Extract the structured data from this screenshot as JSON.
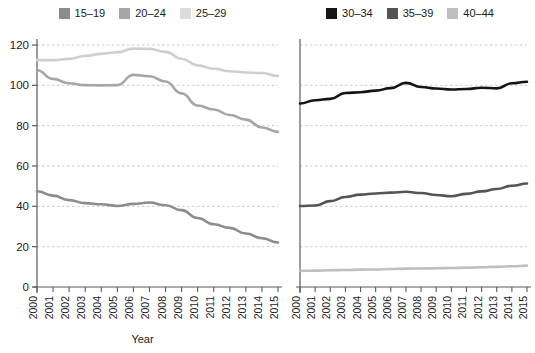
{
  "chart_data": [
    {
      "type": "line",
      "panel": "left",
      "title": "",
      "xlabel": "Year",
      "ylabel": "",
      "x": [
        2000,
        2001,
        2002,
        2003,
        2004,
        2005,
        2006,
        2007,
        2008,
        2009,
        2010,
        2011,
        2012,
        2013,
        2014,
        2015
      ],
      "categories": [
        "2000",
        "2001",
        "2002",
        "2003",
        "2004",
        "2005",
        "2006",
        "2007",
        "2008",
        "2009",
        "2010",
        "2011",
        "2012",
        "2013",
        "2014",
        "2015"
      ],
      "ylim": [
        0,
        120
      ],
      "yticks": [
        0,
        20,
        40,
        60,
        80,
        100,
        120
      ],
      "grid": true,
      "legend_position": "top",
      "series": [
        {
          "name": "15-19",
          "color": "#8c8c8c",
          "values": [
            47.5,
            45.3,
            43.1,
            41.6,
            41.0,
            40.2,
            41.2,
            41.9,
            40.5,
            38.1,
            34.2,
            31.1,
            29.3,
            26.5,
            24.2,
            22.1
          ]
        },
        {
          "name": "20-24",
          "color": "#a6a6a6",
          "values": [
            107.5,
            103.2,
            101.0,
            100.1,
            100.0,
            100.1,
            105.2,
            104.5,
            101.9,
            96.0,
            90.0,
            88.0,
            85.3,
            83.0,
            79.1,
            76.9
          ]
        },
        {
          "name": "25-29",
          "color": "#cfcfcf",
          "values": [
            112.5,
            112.5,
            113.1,
            114.6,
            115.6,
            116.4,
            118.2,
            118.1,
            116.6,
            113.2,
            109.9,
            108.2,
            107.0,
            106.4,
            106.1,
            104.6
          ]
        }
      ]
    },
    {
      "type": "line",
      "panel": "right",
      "title": "",
      "xlabel": "Year",
      "ylabel": "",
      "x": [
        2000,
        2001,
        2002,
        2003,
        2004,
        2005,
        2006,
        2007,
        2008,
        2009,
        2010,
        2011,
        2012,
        2013,
        2014,
        2015
      ],
      "categories": [
        "2000",
        "2001",
        "2002",
        "2003",
        "2004",
        "2005",
        "2006",
        "2007",
        "2008",
        "2009",
        "2010",
        "2011",
        "2012",
        "2013",
        "2014",
        "2015"
      ],
      "ylim": [
        0,
        120
      ],
      "yticks": [
        0,
        20,
        40,
        60,
        80,
        100,
        120
      ],
      "grid": true,
      "legend_position": "top",
      "series": [
        {
          "name": "30-34",
          "color": "#141414",
          "values": [
            91.0,
            92.6,
            93.3,
            96.2,
            96.6,
            97.4,
            98.6,
            101.2,
            99.2,
            98.4,
            97.9,
            98.2,
            98.8,
            98.5,
            101.0,
            101.8
          ]
        },
        {
          "name": "35-39",
          "color": "#545454",
          "values": [
            40.2,
            40.4,
            42.6,
            44.6,
            45.8,
            46.4,
            46.8,
            47.2,
            46.6,
            45.6,
            45.0,
            46.2,
            47.4,
            48.6,
            50.2,
            51.3
          ]
        },
        {
          "name": "40-44",
          "color": "#bfbfbf",
          "values": [
            8.0,
            8.1,
            8.3,
            8.4,
            8.6,
            8.7,
            8.9,
            9.1,
            9.2,
            9.3,
            9.4,
            9.6,
            9.8,
            10.0,
            10.3,
            10.6
          ]
        }
      ]
    }
  ],
  "legend_left": {
    "items": [
      {
        "label": "15–19",
        "color": "#8c8c8c"
      },
      {
        "label": "20–24",
        "color": "#a6a6a6"
      },
      {
        "label": "25–29",
        "color": "#dcdcdc"
      }
    ]
  },
  "legend_right": {
    "items": [
      {
        "label": "30–34",
        "color": "#141414"
      },
      {
        "label": "35–39",
        "color": "#545454"
      },
      {
        "label": "40–44",
        "color": "#bfbfbf"
      }
    ]
  },
  "axes": {
    "xlabel_left": "Year",
    "xlabel_right": "Year",
    "ytick_labels": [
      "0",
      "20",
      "40",
      "60",
      "80",
      "100",
      "120"
    ],
    "xtick_labels": [
      "2000",
      "2001",
      "2002",
      "2003",
      "2004",
      "2005",
      "2006",
      "2007",
      "2008",
      "2009",
      "2010",
      "2011",
      "2012",
      "2013",
      "2014",
      "2015"
    ]
  },
  "style": {
    "grid_color": "#cccccc",
    "axis_color": "#5a5a5a",
    "background": "#ffffff"
  }
}
